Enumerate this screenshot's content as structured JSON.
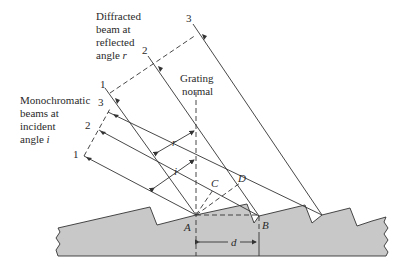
{
  "diagram": {
    "type": "reflection-grating-diffraction",
    "labels": {
      "diffracted_title_1": "Diffracted",
      "diffracted_title_2": "beam at",
      "diffracted_title_3": "reflected",
      "diffracted_title_4": "angle ",
      "diffracted_angle_symbol": "r",
      "incident_title_1": "Monochromatic",
      "incident_title_2": "beams at",
      "incident_title_3": "incident",
      "incident_title_4": "angle ",
      "incident_angle_symbol": "i",
      "normal_1": "Grating",
      "normal_2": "normal",
      "point_a": "A",
      "point_b": "B",
      "point_c": "C",
      "point_d": "D",
      "spacing": "d",
      "angle_r": "r",
      "angle_i": "i"
    },
    "incident_beams": [
      "1",
      "2",
      "3"
    ],
    "diffracted_beams": [
      "1",
      "2",
      "3"
    ],
    "colors": {
      "line": "#333333",
      "grating_fill": "#c8c8c8",
      "background": "#ffffff"
    }
  }
}
